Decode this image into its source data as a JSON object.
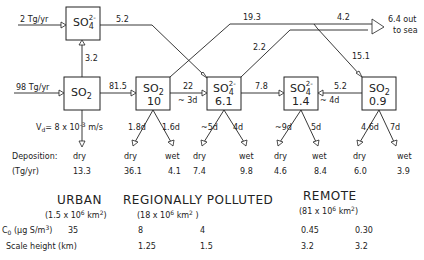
{
  "inputs": {
    "sulfate_source": "2 Tg/yr",
    "so2_source": "98 Tg/yr"
  },
  "boxes": {
    "urban_sulfate": {
      "species": "SO",
      "sub": "4",
      "sup": "2-"
    },
    "urban_so2": {
      "species": "SO",
      "sub": "2"
    },
    "regional_so2": {
      "species": "SO",
      "sub": "2",
      "value": "10"
    },
    "regional_sulfate": {
      "species": "SO",
      "sub": "4",
      "sup": "2-",
      "value": "6.1"
    },
    "remote_sulfate": {
      "species": "SO",
      "sub": "4",
      "sup": "2-",
      "value": "1.4"
    },
    "remote_so2": {
      "species": "SO",
      "sub": "2",
      "value": "0.9"
    }
  },
  "flows": {
    "urban_sulfate_out": "5.2",
    "urban_so2_to_sulfate": "3.2",
    "urban_so2_to_regional": "81.5",
    "regional_so2_to_sulfate": "22",
    "regional_so2_to_sulfate_time": "~ 3d",
    "regional_so2_to_remote": "19.3",
    "regional_sulfate_out": "2.2",
    "to_sea_flow": "4.2",
    "to_sea_label_1": "6.4 out",
    "to_sea_label_2": "to sea",
    "remote_so2_in": "15.1",
    "regional_to_remote_sulfate": "7.8",
    "remote_so2_to_sulfate": "5.2",
    "remote_so2_to_sulfate_time": "~ 4d"
  },
  "lifetimes": {
    "vd": "V",
    "vd_sub": "d",
    "vd_value": "= 8 x 10",
    "vd_exp": "-3",
    "vd_unit": " m/s",
    "regional_so2_dry": "1.8d",
    "regional_so2_wet": "1.6d",
    "regional_sulfate_dry": "~5d",
    "regional_sulfate_wet": "4d",
    "remote_sulfate_dry": "~9d",
    "remote_sulfate_wet": "5d",
    "remote_so2_dry": "4.6d",
    "remote_so2_wet": "7d"
  },
  "deposition": {
    "label": "Deposition:",
    "unit_label": "(Tg/yr)",
    "columns": [
      {
        "type": "dry",
        "value": "13.3"
      },
      {
        "type": "dry",
        "value": "36.1"
      },
      {
        "type": "wet",
        "value": "4.1"
      },
      {
        "type": "dry",
        "value": "7.4"
      },
      {
        "type": "wet",
        "value": "9.8"
      },
      {
        "type": "dry",
        "value": "4.6"
      },
      {
        "type": "wet",
        "value": "8.4"
      },
      {
        "type": "dry",
        "value": "6.0"
      },
      {
        "type": "wet",
        "value": "3.9"
      }
    ]
  },
  "regions": [
    {
      "name": "URBAN",
      "area": "(1.5 x 10",
      "area_exp": "6",
      "area_unit": " km",
      "area_close": ")"
    },
    {
      "name": "REGIONALLY POLLUTED",
      "area": "(18 x 10",
      "area_exp": "6",
      "area_unit": " km",
      "area_close": " )"
    },
    {
      "name": "REMOTE",
      "area": "(81 x 10",
      "area_exp": "6",
      "area_unit": " km",
      "area_close": ")"
    }
  ],
  "table": {
    "rows": [
      {
        "label": "C",
        "label_sub": "0",
        "label_rest": " (μg S/m",
        "label_exp": "3",
        "label_close": ")",
        "values": [
          "35",
          "8",
          "4",
          "0.45",
          "0.30"
        ]
      },
      {
        "label": "Scale height (km)",
        "values": [
          "",
          "1.25",
          "1.5",
          "3.2",
          "3.2"
        ]
      }
    ]
  }
}
